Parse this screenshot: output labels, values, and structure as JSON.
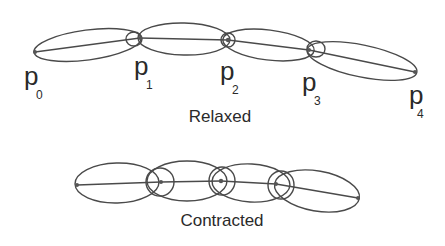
{
  "relaxed": {
    "caption": "Relaxed",
    "points": [
      {
        "label": "p",
        "sub": "0",
        "x": 35,
        "y": 52
      },
      {
        "label": "p",
        "sub": "1",
        "x": 140,
        "y": 38
      },
      {
        "label": "p",
        "sub": "2",
        "x": 228,
        "y": 40
      },
      {
        "label": "p",
        "sub": "3",
        "x": 309,
        "y": 50
      },
      {
        "label": "p",
        "sub": "4",
        "x": 415,
        "y": 72
      }
    ]
  },
  "contracted": {
    "caption": "Contracted",
    "points": [
      {
        "x": 77,
        "y": 185
      },
      {
        "x": 161,
        "y": 182
      },
      {
        "x": 221,
        "y": 181
      },
      {
        "x": 276,
        "y": 184
      },
      {
        "x": 358,
        "y": 198
      }
    ]
  },
  "colors": {
    "stroke": "#4a4a4a",
    "text": "#2a2a2a",
    "background": "#ffffff"
  }
}
